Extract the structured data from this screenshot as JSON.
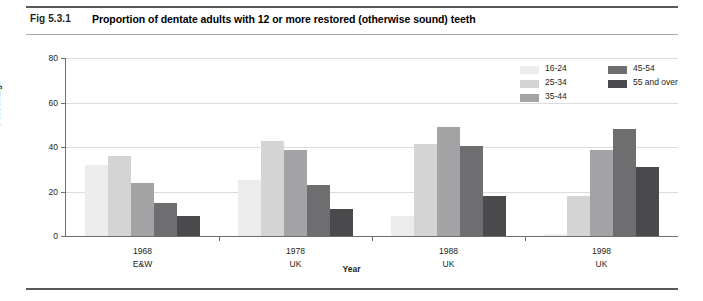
{
  "header": {
    "fig_id": "Fig 5.3.1",
    "title": "Proportion of dentate adults with 12 or more restored (otherwise sound) teeth"
  },
  "chart_data": {
    "type": "bar",
    "title": "Proportion of dentate adults with 12 or more restored (otherwise sound) teeth",
    "xlabel": "Year",
    "ylabel": "Percentage",
    "ylim": [
      0,
      80
    ],
    "yticks": [
      0,
      20,
      40,
      60,
      80
    ],
    "grid": true,
    "legend_position": "top-right",
    "categories": [
      "1968",
      "1978",
      "1988",
      "1998"
    ],
    "category_sublabels": [
      "E&W",
      "UK",
      "UK",
      "UK"
    ],
    "series": [
      {
        "name": "16-24",
        "color": "#ececed",
        "values": [
          32,
          25,
          9,
          1
        ]
      },
      {
        "name": "25-34",
        "color": "#d4d4d5",
        "values": [
          36,
          42.5,
          41.5,
          18
        ]
      },
      {
        "name": "35-44",
        "color": "#a3a3a5",
        "values": [
          24,
          38.5,
          49,
          38.5
        ]
      },
      {
        "name": "45-54",
        "color": "#6e6e70",
        "values": [
          15,
          23,
          40.5,
          48
        ]
      },
      {
        "name": "55 and over",
        "color": "#4a4a4c",
        "values": [
          9,
          12,
          18,
          31
        ]
      }
    ]
  },
  "legend": {
    "column_left": [
      "16-24",
      "25-34",
      "35-44"
    ],
    "column_right": [
      "45-54",
      "55 and over"
    ]
  },
  "colors": {
    "rule_dark": "#58585a",
    "rule_light": "#a9a9ac",
    "axis": "#6f7072",
    "grid": "#dcdcde"
  }
}
